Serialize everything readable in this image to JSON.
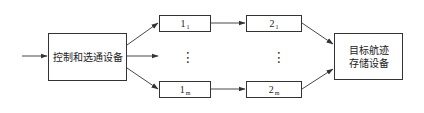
{
  "diagram": {
    "type": "flow",
    "nodes": {
      "control": {
        "label": "控制和选通设备"
      },
      "n1_1": {
        "main": "1",
        "sub": "1"
      },
      "n1_m": {
        "main": "1",
        "sub": "m"
      },
      "n2_1": {
        "main": "2",
        "sub": "1"
      },
      "n2_m": {
        "main": "2",
        "sub": "m"
      },
      "target": {
        "line1": "目标航迹",
        "line2": "存储设备"
      }
    },
    "ellipsis": {
      "col1": "⋮",
      "col2": "⋮"
    },
    "edges": [
      {
        "from": "input",
        "to": "control"
      },
      {
        "from": "control",
        "to": "n1_1"
      },
      {
        "from": "control",
        "to": "ellipsis"
      },
      {
        "from": "control",
        "to": "n1_m"
      },
      {
        "from": "n1_1",
        "to": "n2_1"
      },
      {
        "from": "n1_m",
        "to": "n2_m"
      },
      {
        "from": "n2_1",
        "to": "target"
      },
      {
        "from": "n2_m",
        "to": "target"
      }
    ],
    "colors": {
      "line": "#333333",
      "background": "#ffffff"
    }
  }
}
